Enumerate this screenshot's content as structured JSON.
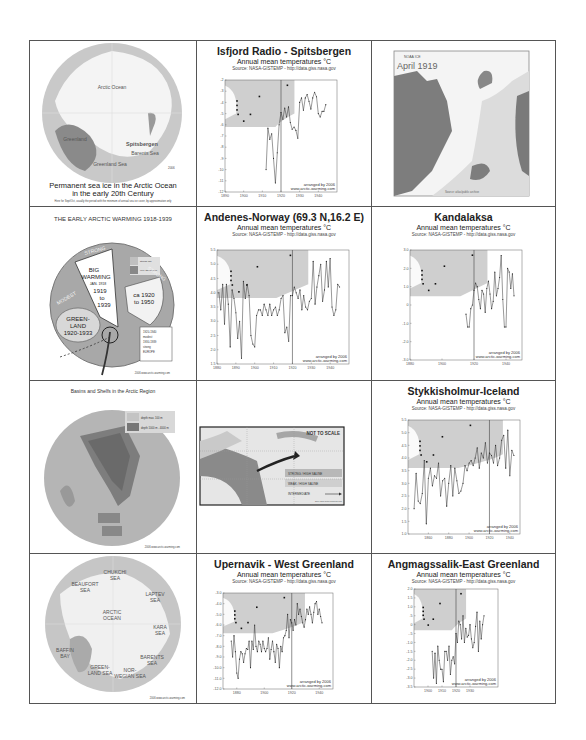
{
  "cells": {
    "sea_ice_map": {
      "labels": [
        "Arctic Ocean",
        "Greenland",
        "Spitsbergen",
        "Barents Sea",
        "Greenland Sea"
      ],
      "caption_line1": "Permanent sea ice in the Arctic Ocean",
      "caption_line2": "in the early 20th Century",
      "note": "Here for Sept/Oct, usually the period with the minimum of annual sea ice cover, by approximation only",
      "stamp": "2006"
    },
    "isfjord": {
      "title": "Isfjord Radio - Spitsbergen",
      "subtitle": "Annual mean temperatures °C",
      "source": "Source: NASA-GISTEMP - http://data.giss.nasa.gov",
      "credit1": "arranged by 2006",
      "credit2": "www.arctic-warming.com"
    },
    "april_1919": {
      "small_label": "NOAA ICE",
      "title": "April 1919",
      "footer": "Source: atlas/public archive"
    },
    "early_warming": {
      "title": "THE EARLY ARCTIC WARMING 1918-1939",
      "big_warming": [
        "BIG",
        "WARMING",
        "JAN. 1918",
        "1919",
        "to",
        "1939"
      ],
      "greenland": [
        "GREEN-",
        "LAND",
        "1920-1933"
      ],
      "ca_range": [
        "ca 1920",
        "to 1950"
      ],
      "sector_labels": [
        "STRONG",
        "MODEST",
        "STRONG"
      ],
      "legend": [
        "strong rise",
        "very strong rise"
      ],
      "europe_note": [
        "1920-1940",
        "modest",
        "1930-1939",
        "strong",
        "EUROPE"
      ],
      "credit": "2006 www.arctic-warming.com"
    },
    "andenes": {
      "title": "Andenes-Norway  (69.3 N,16.2 E)",
      "subtitle": "Annual mean temperatures °C",
      "source": "Source: NASA-GISTEMP - http://data.giss.nasa.gov",
      "credit1": "arranged by 2006",
      "credit2": "www.arctic-warming.com"
    },
    "kandalaksa": {
      "title": "Kandalaksa",
      "subtitle": "Annual mean temperatures °C",
      "source": "Source: NASA-GISTEMP - http://data.giss.nasa.gov",
      "credit1": "arranged by 2006",
      "credit2": "www.arctic-warming.com"
    },
    "basins": {
      "title": "Basins and Shelfs in the Arctic Region",
      "legend": [
        "depth max. 100 m",
        "depth 1000 m - 4000 m"
      ],
      "credit": "2006 www.arctic-warming.com"
    },
    "current_diagram": {
      "label": "NOT TO SCALE",
      "legend": [
        "STRONG / HIGH SALINE",
        "WEAK / HIGH SALINE",
        "INTERMEDIATE"
      ],
      "credit": "2006 www.arctic-warming.com"
    },
    "stykkisholmur": {
      "title": "Stykkisholmur-Iceland",
      "subtitle": "Annual mean temperatures °C",
      "source": "Source: NASA-GISTEMP - http://data.giss.nasa.gov",
      "credit1": "arranged by 2006",
      "credit2": "www.arctic-warming.com"
    },
    "seas_map": {
      "labels": [
        {
          "text": "CHUKCHI",
          "text2": "SEA"
        },
        {
          "text": "BEAUFORT",
          "text2": "SEA"
        },
        {
          "text": "LAPTEV",
          "text2": "SEA"
        },
        {
          "text": "ARCTIC",
          "text2": "OCEAN"
        },
        {
          "text": "KARA",
          "text2": "SEA"
        },
        {
          "text": "BAFFIN",
          "text2": "BAY"
        },
        {
          "text": "BARENTS",
          "text2": "SEA"
        },
        {
          "text": "GREEN-",
          "text2": "LAND SEA"
        },
        {
          "text": "NOR-",
          "text2": "WEGIAN SEA"
        }
      ],
      "credit": "2006 www.arctic-warming.com"
    },
    "upernavik": {
      "title": "Upernavik - West Greenland",
      "subtitle": "Annual mean temperatures °C",
      "source": "Source: NASA-GISTEMP - http://data.giss.nasa.gov",
      "credit1": "arranged by 2006",
      "credit2": "www.arctic-warming.com"
    },
    "angmagssalik": {
      "title": "Angmagssalik-East Greenland",
      "subtitle": "Annual mean temperatures °C",
      "source": "Source: NASA-GISTEMP - http://data.giss.nasa.gov",
      "credit1": "arranged by 2006",
      "credit2": "www.arctic-warming.com"
    }
  },
  "chart_data": [
    {
      "id": "isfjord",
      "type": "line",
      "title": "Isfjord Radio - Spitsbergen",
      "ylabel": "°C",
      "xlim": [
        1890,
        1950
      ],
      "ylim": [
        -12,
        -2
      ],
      "x_ticks": [
        "1890",
        "1900",
        "1910",
        "1920",
        "1930",
        "1940"
      ],
      "y_ticks": [
        "-2",
        "-3",
        "-4",
        "-5",
        "-6",
        "-7",
        "-8",
        "-9",
        "-10",
        "-11",
        "-12"
      ],
      "marker_year": 1920,
      "x": [
        1912,
        1913,
        1914,
        1915,
        1916,
        1917,
        1918,
        1919,
        1920,
        1921,
        1922,
        1923,
        1924,
        1925,
        1926,
        1927,
        1928,
        1929,
        1930,
        1931,
        1932,
        1933,
        1934,
        1935,
        1936,
        1937,
        1938,
        1939,
        1940,
        1941,
        1942,
        1943,
        1944
      ],
      "values": [
        -10,
        -6.3,
        -7.3,
        -6.8,
        -9,
        -11.2,
        -8.5,
        -6,
        -4.9,
        -5.5,
        -4.5,
        -5.3,
        -4.4,
        -5.8,
        -6.4,
        -6.2,
        -6.5,
        -7.2,
        -4,
        -3.6,
        -4.7,
        -3.6,
        -3.3,
        -3.9,
        -4.6,
        -3.6,
        -3.1,
        -3.5,
        -5,
        -5.3,
        -4.8,
        -4.8,
        -4.2
      ]
    },
    {
      "id": "andenes",
      "type": "line",
      "title": "Andenes-Norway (69.3 N,16.2 E)",
      "ylabel": "°C",
      "xlim": [
        1880,
        1950
      ],
      "ylim": [
        1.5,
        5.5
      ],
      "x_ticks": [
        "1880",
        "1890",
        "1900",
        "1910",
        "1920",
        "1930",
        "1940"
      ],
      "y_ticks": [
        "5.5",
        "5.0",
        "4.5",
        "4.0",
        "3.5",
        "3.0",
        "2.5",
        "2.0",
        "1.5"
      ],
      "marker_year": 1920,
      "x": [
        1881,
        1882,
        1883,
        1884,
        1885,
        1886,
        1887,
        1888,
        1889,
        1890,
        1891,
        1892,
        1893,
        1894,
        1895,
        1896,
        1897,
        1898,
        1899,
        1900,
        1901,
        1902,
        1903,
        1904,
        1905,
        1906,
        1907,
        1908,
        1909,
        1910,
        1911,
        1912,
        1913,
        1914,
        1915,
        1916,
        1917,
        1918,
        1919,
        1920,
        1921,
        1922,
        1923,
        1924,
        1925,
        1926,
        1927,
        1928,
        1929,
        1930,
        1931,
        1932,
        1933,
        1934,
        1935,
        1936,
        1937,
        1938,
        1939,
        1940,
        1941,
        1942,
        1943,
        1944,
        1945
      ],
      "values": [
        4.0,
        3.4,
        4.3,
        2.9,
        4.3,
        3.6,
        2.1,
        4.1,
        3.8,
        3.3,
        2.4,
        3.0,
        1.7,
        4.4,
        3.8,
        4.3,
        3.9,
        2.5,
        2.2,
        2.1,
        3.2,
        3.4,
        3.4,
        3.2,
        3.6,
        3.4,
        3.2,
        3.6,
        3.2,
        3.4,
        3.5,
        3.2,
        3.4,
        3.8,
        3.9,
        2.6,
        2.8,
        2.3,
        3.9,
        3.9,
        4.2,
        4.0,
        3.8,
        4.1,
        3.4,
        3.9,
        3.5,
        3.4,
        3.7,
        3.8,
        5.1,
        3.6,
        4.2,
        4.6,
        5.0,
        3.7,
        4.1,
        5.1,
        4.2,
        5.2,
        3.5,
        3.2,
        3.4,
        4.3,
        4.2
      ]
    },
    {
      "id": "kandalaksa",
      "type": "line",
      "title": "Kandalaksa",
      "ylabel": "°C",
      "xlim": [
        1880,
        1950
      ],
      "ylim": [
        -3.0,
        3.0
      ],
      "x_ticks": [
        "1880",
        "1900",
        "1920",
        "1940"
      ],
      "y_ticks": [
        "3.0",
        "2.0",
        "1.0",
        "0",
        "-1.0",
        "-2.0",
        "-3.0"
      ],
      "marker_year": 1920,
      "x": [
        1915,
        1916,
        1917,
        1918,
        1919,
        1920,
        1921,
        1922,
        1923,
        1924,
        1925,
        1926,
        1927,
        1928,
        1929,
        1930,
        1931,
        1932,
        1933,
        1934,
        1935,
        1936,
        1937,
        1938,
        1939,
        1940,
        1941,
        1942,
        1943,
        1944,
        1945
      ],
      "values": [
        -0.5,
        -1.2,
        -1.2,
        -0.2,
        0,
        0.8,
        1.2,
        1.0,
        0.3,
        -0.2,
        0.8,
        0.6,
        -0.4,
        0.9,
        1.3,
        0.6,
        -0.2,
        0.2,
        1.8,
        0.5,
        0.9,
        1.5,
        2.7,
        0.3,
        -1.2,
        -1.2,
        2.0,
        1.8,
        0.9,
        1.7,
        0.5
      ]
    },
    {
      "id": "stykkisholmur",
      "type": "line",
      "title": "Stykkisholmur-Iceland",
      "ylabel": "°C",
      "xlim": [
        1840,
        1950
      ],
      "ylim": [
        1.0,
        5.5
      ],
      "x_ticks": [
        "1860",
        "1880",
        "1900",
        "1920",
        "1940"
      ],
      "y_ticks": [
        "5.5",
        "5.0",
        "4.5",
        "4.0",
        "3.5",
        "3.0",
        "2.5",
        "2.0",
        "1.5",
        "1.0"
      ],
      "marker_year": 1920,
      "x": [
        1846,
        1848,
        1850,
        1852,
        1854,
        1856,
        1858,
        1860,
        1862,
        1864,
        1866,
        1868,
        1870,
        1872,
        1874,
        1876,
        1878,
        1880,
        1882,
        1884,
        1886,
        1888,
        1890,
        1892,
        1894,
        1896,
        1898,
        1900,
        1902,
        1904,
        1906,
        1908,
        1910,
        1912,
        1914,
        1916,
        1918,
        1920,
        1922,
        1924,
        1926,
        1928,
        1930,
        1932,
        1934,
        1936,
        1938,
        1940,
        1942,
        1944
      ],
      "values": [
        2.0,
        3.4,
        2.3,
        2.2,
        2.6,
        3.9,
        1.4,
        3.2,
        3.6,
        2.9,
        3.3,
        3.2,
        3.8,
        2.5,
        3.1,
        3.2,
        2.1,
        3.0,
        3.7,
        2.5,
        3.6,
        3.1,
        2.6,
        2.7,
        3.0,
        3.7,
        3.5,
        3.8,
        3.9,
        3.7,
        4.0,
        4.4,
        3.6,
        4.2,
        4.0,
        4.6,
        3.8,
        4.2,
        4.1,
        3.8,
        4.5,
        3.7,
        4.0,
        4.7,
        4.9,
        3.6,
        5.1,
        3.3,
        4.3,
        4.1
      ]
    },
    {
      "id": "upernavik",
      "type": "line",
      "title": "Upernavik - West Greenland",
      "ylabel": "°C",
      "xlim": [
        1870,
        1950
      ],
      "ylim": [
        -12.0,
        -3.0
      ],
      "x_ticks": [
        "1880",
        "1900",
        "1920",
        "1940"
      ],
      "y_ticks": [
        "-3.0",
        "-4.0",
        "-5.0",
        "-6.0",
        "-7.0",
        "-8.0",
        "-9.0",
        "-10.0",
        "-11.0",
        "-12.0"
      ],
      "marker_year": 1920,
      "x": [
        1876,
        1877,
        1878,
        1879,
        1880,
        1881,
        1882,
        1883,
        1884,
        1885,
        1886,
        1887,
        1888,
        1889,
        1890,
        1891,
        1892,
        1893,
        1894,
        1895,
        1896,
        1897,
        1898,
        1899,
        1900,
        1901,
        1902,
        1903,
        1904,
        1905,
        1906,
        1907,
        1908,
        1909,
        1910,
        1911,
        1912,
        1913,
        1914,
        1915,
        1916,
        1917,
        1918,
        1919,
        1920,
        1921,
        1922,
        1923,
        1924,
        1925,
        1926,
        1927,
        1928,
        1929,
        1930,
        1931,
        1932,
        1933,
        1934,
        1935,
        1936,
        1937,
        1938,
        1939,
        1940,
        1941,
        1942
      ],
      "values": [
        -7.5,
        -9.0,
        -7.0,
        -8.5,
        -10.5,
        -11.0,
        -9.2,
        -8.5,
        -8.7,
        -9.5,
        -8.7,
        -8.2,
        -8.3,
        -7.5,
        -10.0,
        -7.5,
        -8.3,
        -6.0,
        -8.0,
        -8.5,
        -7.5,
        -7.8,
        -8.5,
        -7.5,
        -8.2,
        -8.5,
        -8.2,
        -7.2,
        -9.2,
        -8.3,
        -7.5,
        -8.5,
        -9.5,
        -7.8,
        -8.2,
        -10.0,
        -8.0,
        -8.5,
        -7.2,
        -7.0,
        -6.5,
        -5.0,
        -7.2,
        -5.5,
        -5.8,
        -6.5,
        -5.5,
        -6.0,
        -4.0,
        -5.0,
        -4.5,
        -5.2,
        -5.8,
        -6.2,
        -5.5,
        -4.5,
        -5.0,
        -4.3,
        -5.0,
        -5.8,
        -4.8,
        -4.0,
        -3.8,
        -5.0,
        -4.5,
        -5.2,
        -5.8
      ]
    },
    {
      "id": "angmagssalik",
      "type": "line",
      "title": "Angmagssalik-East Greenland",
      "ylabel": "°C",
      "xlim": [
        1890,
        1950
      ],
      "ylim": [
        -3.5,
        2.0
      ],
      "x_ticks": [
        "1900",
        "1910",
        "1920",
        "1930"
      ],
      "y_ticks": [
        "2.0",
        "1.5",
        "1.0",
        ".5",
        "0",
        "-.5",
        "-1.0",
        "-1.5",
        "-2.0",
        "-2.5",
        "-3.0",
        "-3.5"
      ],
      "marker_year": 1920,
      "x": [
        1903,
        1904,
        1905,
        1906,
        1907,
        1908,
        1909,
        1910,
        1911,
        1912,
        1913,
        1914,
        1915,
        1916,
        1917,
        1918,
        1919,
        1920,
        1921,
        1922,
        1923,
        1924,
        1925,
        1926,
        1927,
        1928,
        1929,
        1930,
        1931,
        1932,
        1933,
        1934,
        1935,
        1936,
        1937,
        1938,
        1939,
        1940
      ],
      "values": [
        -1.5,
        -3.0,
        -1.6,
        -3.3,
        -1.2,
        -2.0,
        -2.5,
        -2.5,
        -3.2,
        -1.5,
        -1.5,
        -2.0,
        -1.2,
        -2.8,
        -2.0,
        -1.8,
        -2.2,
        -0.5,
        -1.0,
        0.2,
        0.0,
        -0.8,
        0.5,
        -1.0,
        -0.2,
        -0.7,
        -0.6,
        0.0,
        -0.8,
        -1.3,
        -1.0,
        -0.1,
        0.7,
        -1.5,
        0.2,
        -0.8,
        0.0,
        0.5
      ]
    }
  ]
}
